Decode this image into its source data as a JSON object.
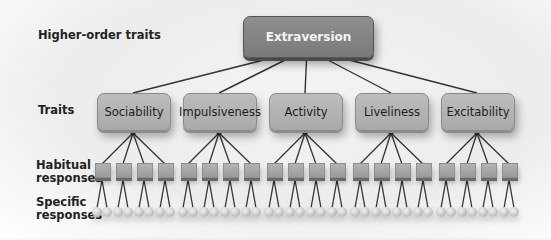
{
  "labels": {
    "higher_order": "Higher-order traits",
    "traits": "Traits",
    "habitual": "Habitual responses",
    "habitual_line1": "Habitual",
    "habitual_line2": "responses",
    "specific": "Specific responses",
    "specific_line1": "Specific",
    "specific_line2": "responses"
  },
  "higher_order_trait": "Extraversion",
  "traits": [
    {
      "label": "Sociability",
      "center_x": 133
    },
    {
      "label": "Impulsiveness",
      "center_x": 219
    },
    {
      "label": "Activity",
      "center_x": 305
    },
    {
      "label": "Liveliness",
      "center_x": 391
    },
    {
      "label": "Excitability",
      "center_x": 477
    }
  ],
  "habitual_responses_per_trait": 4,
  "specific_responses_per_habitual": 2,
  "colors": {
    "top_box": "#858585",
    "trait_box": "#b3b3b3",
    "line": "#333333",
    "text_dark": "#222222",
    "text_light": "#f4f4f4"
  }
}
